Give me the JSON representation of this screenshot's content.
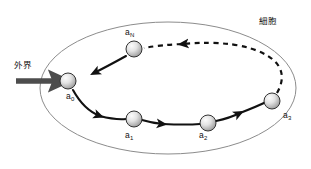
{
  "diagram": {
    "title_visible": false,
    "container": {
      "label": "細胞",
      "shape": "ellipse",
      "stroke_color": "#8c8c8c",
      "fill_color": "#ffffff"
    },
    "external": {
      "label": "外界",
      "arrow_color": "#4d4d4d",
      "arrow_direction": "right"
    },
    "nodes": [
      {
        "id": "a0",
        "label": "a",
        "subscript": "0",
        "cx": 68,
        "cy": 81
      },
      {
        "id": "a1",
        "label": "a",
        "subscript": "1",
        "cx": 134,
        "cy": 119
      },
      {
        "id": "a2",
        "label": "a",
        "subscript": "2",
        "cx": 208,
        "cy": 123
      },
      {
        "id": "a3",
        "label": "a",
        "subscript": "3",
        "cx": 272,
        "cy": 101
      },
      {
        "id": "aN",
        "label": "a",
        "subscript": "N",
        "cx": 134,
        "cy": 49
      }
    ],
    "node_style": {
      "radius": 8,
      "fill_light": "#f2f2f2",
      "fill_dark": "#a8a8a8",
      "stroke_color": "#333333"
    },
    "edges": [
      {
        "from": "a0",
        "to": "a1",
        "style": "solid"
      },
      {
        "from": "a1",
        "to": "a2",
        "style": "solid"
      },
      {
        "from": "a2",
        "to": "a3",
        "style": "solid"
      },
      {
        "from": "a3",
        "to": "aN",
        "style": "dashed"
      },
      {
        "from": "aN",
        "to": "a0",
        "style": "solid"
      }
    ],
    "edge_color": "#111111"
  }
}
